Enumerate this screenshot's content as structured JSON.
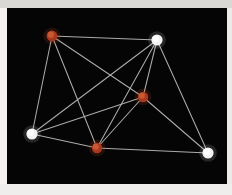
{
  "figure": {
    "background_color": "#050505",
    "border_color": "#f2f1ef",
    "edge_color": "#b9b8b6",
    "node_colors": {
      "red": "#c85a33",
      "white": "#ffffff"
    },
    "width": 232,
    "height": 195
  },
  "chart_data": {
    "type": "scatter",
    "title": "",
    "xlabel": "",
    "ylabel": "",
    "grid": false,
    "legend": null,
    "plot_area": {
      "x": 7,
      "y": 8,
      "width": 220,
      "height": 176
    },
    "nodes": [
      {
        "id": "A",
        "label": "top-left-red-node",
        "x": 45,
        "y": 28,
        "r": 5.4,
        "color": "#c85a33",
        "type": "red"
      },
      {
        "id": "B",
        "label": "top-right-white-node",
        "x": 150,
        "y": 32,
        "r": 5.6,
        "color": "#ffffff",
        "type": "white"
      },
      {
        "id": "C",
        "label": "center-red-node",
        "x": 136,
        "y": 89,
        "r": 5.2,
        "color": "#c85a33",
        "type": "red"
      },
      {
        "id": "D",
        "label": "bottom-left-white-node",
        "x": 25,
        "y": 126,
        "r": 5.6,
        "color": "#ffffff",
        "type": "white"
      },
      {
        "id": "E",
        "label": "bottom-center-red-node",
        "x": 90,
        "y": 140,
        "r": 5.2,
        "color": "#c85a33",
        "type": "red"
      },
      {
        "id": "F",
        "label": "bottom-right-white-node",
        "x": 201,
        "y": 145,
        "r": 5.6,
        "color": "#ffffff",
        "type": "white"
      }
    ],
    "edges": [
      {
        "source": "A",
        "target": "B"
      },
      {
        "source": "A",
        "target": "C"
      },
      {
        "source": "A",
        "target": "D"
      },
      {
        "source": "A",
        "target": "E"
      },
      {
        "source": "B",
        "target": "C"
      },
      {
        "source": "B",
        "target": "D"
      },
      {
        "source": "B",
        "target": "E"
      },
      {
        "source": "B",
        "target": "F"
      },
      {
        "source": "C",
        "target": "D"
      },
      {
        "source": "C",
        "target": "E"
      },
      {
        "source": "C",
        "target": "F"
      },
      {
        "source": "D",
        "target": "E"
      },
      {
        "source": "E",
        "target": "F"
      }
    ]
  }
}
